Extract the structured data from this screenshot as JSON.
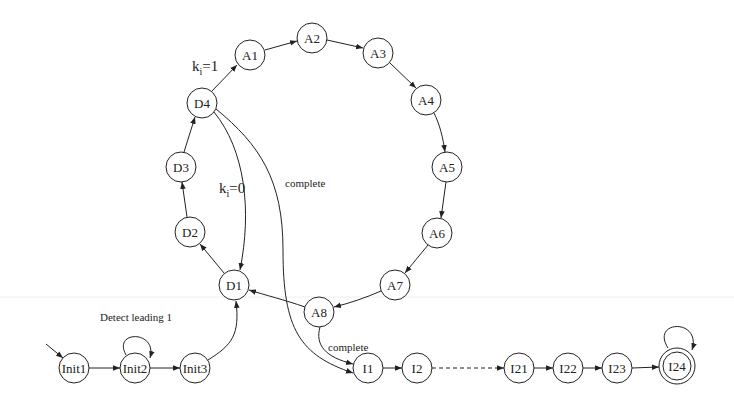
{
  "diagram": {
    "type": "state-machine",
    "nodes": [
      {
        "id": "Init1",
        "label": "Init1",
        "x": 74,
        "y": 368
      },
      {
        "id": "Init2",
        "label": "Init2",
        "x": 135,
        "y": 368
      },
      {
        "id": "Init3",
        "label": "Init3",
        "x": 195,
        "y": 368
      },
      {
        "id": "D1",
        "label": "D1",
        "x": 234,
        "y": 285
      },
      {
        "id": "D2",
        "label": "D2",
        "x": 190,
        "y": 232
      },
      {
        "id": "D3",
        "label": "D3",
        "x": 181,
        "y": 167
      },
      {
        "id": "D4",
        "label": "D4",
        "x": 202,
        "y": 103
      },
      {
        "id": "A1",
        "label": "A1",
        "x": 250,
        "y": 55
      },
      {
        "id": "A2",
        "label": "A2",
        "x": 312,
        "y": 38
      },
      {
        "id": "A3",
        "label": "A3",
        "x": 378,
        "y": 53
      },
      {
        "id": "A4",
        "label": "A4",
        "x": 426,
        "y": 100
      },
      {
        "id": "A5",
        "label": "A5",
        "x": 447,
        "y": 167
      },
      {
        "id": "A6",
        "label": "A6",
        "x": 437,
        "y": 233
      },
      {
        "id": "A7",
        "label": "A7",
        "x": 395,
        "y": 285
      },
      {
        "id": "A8",
        "label": "A8",
        "x": 319,
        "y": 312
      },
      {
        "id": "I1",
        "label": "I1",
        "x": 368,
        "y": 368
      },
      {
        "id": "I2",
        "label": "I2",
        "x": 417,
        "y": 368
      },
      {
        "id": "I21",
        "label": "I21",
        "x": 519,
        "y": 368
      },
      {
        "id": "I22",
        "label": "I22",
        "x": 568,
        "y": 368
      },
      {
        "id": "I23",
        "label": "I23",
        "x": 617,
        "y": 368
      },
      {
        "id": "I24",
        "label": "I24",
        "x": 677,
        "y": 366,
        "accepting": true
      }
    ],
    "edges": [
      {
        "from": "start",
        "to": "Init1"
      },
      {
        "from": "Init1",
        "to": "Init2"
      },
      {
        "from": "Init2",
        "to": "Init2",
        "label": "Detect leading 1",
        "self_loop": true
      },
      {
        "from": "Init2",
        "to": "Init3"
      },
      {
        "from": "Init3",
        "to": "D1"
      },
      {
        "from": "D1",
        "to": "D2"
      },
      {
        "from": "D2",
        "to": "D3"
      },
      {
        "from": "D3",
        "to": "D4"
      },
      {
        "from": "D4",
        "to": "A1",
        "label": "k_i=1"
      },
      {
        "from": "D4",
        "to": "D1",
        "label": "k_i=0"
      },
      {
        "from": "D4",
        "to": "I1",
        "label": "complete"
      },
      {
        "from": "A1",
        "to": "A2"
      },
      {
        "from": "A2",
        "to": "A3"
      },
      {
        "from": "A3",
        "to": "A4"
      },
      {
        "from": "A4",
        "to": "A5"
      },
      {
        "from": "A5",
        "to": "A6"
      },
      {
        "from": "A6",
        "to": "A7"
      },
      {
        "from": "A7",
        "to": "A8"
      },
      {
        "from": "A8",
        "to": "D1"
      },
      {
        "from": "A8",
        "to": "I1",
        "label": "complete"
      },
      {
        "from": "I1",
        "to": "I2"
      },
      {
        "from": "I2",
        "to": "I21",
        "dashed": true
      },
      {
        "from": "I21",
        "to": "I22"
      },
      {
        "from": "I22",
        "to": "I23"
      },
      {
        "from": "I23",
        "to": "I24"
      },
      {
        "from": "I24",
        "to": "I24",
        "self_loop": true
      }
    ]
  },
  "labels": {
    "detect_leading": "Detect leading 1",
    "ki1_k": "k",
    "ki1_sub": "i",
    "ki1_rest": "=1",
    "ki0_k": "k",
    "ki0_sub": "i",
    "ki0_rest": "=0",
    "complete_d4": "complete",
    "complete_a8": "complete"
  }
}
